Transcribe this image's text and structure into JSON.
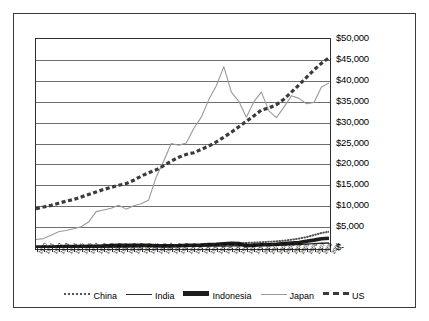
{
  "chart_data": {
    "type": "line",
    "title": "",
    "xlabel": "",
    "ylabel": "",
    "ylim": [
      0,
      50000
    ],
    "ytick_values": [
      0,
      5000,
      10000,
      15000,
      20000,
      25000,
      30000,
      35000,
      40000,
      45000,
      50000
    ],
    "ytick_labels": [
      "$-",
      "$5,000",
      "$10,000",
      "$15,000",
      "$20,000",
      "$25,000",
      "$30,000",
      "$35,000",
      "$40,000",
      "$45,000",
      "$50,000"
    ],
    "grid": true,
    "legend_position": "bottom",
    "x": [
      1970,
      1971,
      1972,
      1973,
      1974,
      1975,
      1976,
      1977,
      1978,
      1979,
      1980,
      1981,
      1982,
      1983,
      1984,
      1985,
      1986,
      1987,
      1988,
      1989,
      1990,
      1991,
      1992,
      1993,
      1994,
      1995,
      1996,
      1997,
      1998,
      1999,
      2000,
      2001,
      2002,
      2003,
      2004,
      2005,
      2006,
      2007,
      2008,
      2009
    ],
    "xtick_labels": [
      "1970",
      "1971",
      "1972",
      "1973",
      "1974",
      "1975",
      "1976",
      "1977",
      "1978",
      "1979",
      "1980",
      "1981",
      "1982",
      "1983",
      "1984",
      "1985",
      "1986",
      "1987",
      "1988",
      "1989",
      "1990",
      "1991",
      "1992",
      "1993",
      "1994",
      "1995",
      "1996",
      "1997",
      "1998",
      "1999",
      "2000",
      "2001",
      "2002",
      "2003",
      "2004",
      "2005",
      "2006",
      "2007",
      "2008",
      "2009"
    ],
    "series": [
      {
        "name": "China",
        "style": "dotted",
        "color": "#555555",
        "values": [
          120,
          125,
          130,
          140,
          145,
          150,
          150,
          160,
          175,
          195,
          215,
          230,
          255,
          285,
          325,
          365,
          395,
          430,
          480,
          510,
          530,
          570,
          640,
          730,
          830,
          930,
          1030,
          1130,
          1210,
          1290,
          1380,
          1480,
          1600,
          1760,
          1990,
          2250,
          2600,
          3100,
          3600,
          3900
        ]
      },
      {
        "name": "India",
        "style": "thin-solid",
        "color": "#2b2b2b",
        "values": [
          180,
          185,
          180,
          195,
          215,
          225,
          220,
          240,
          255,
          260,
          270,
          290,
          300,
          320,
          330,
          340,
          350,
          370,
          400,
          410,
          420,
          420,
          430,
          440,
          460,
          490,
          520,
          540,
          560,
          600,
          620,
          630,
          660,
          700,
          760,
          830,
          920,
          1050,
          1150,
          1200
        ]
      },
      {
        "name": "Indonesia",
        "style": "thick-solid",
        "color": "#1d1d1d",
        "values": [
          200,
          215,
          235,
          280,
          330,
          350,
          370,
          400,
          430,
          480,
          560,
          620,
          640,
          630,
          640,
          660,
          550,
          500,
          510,
          550,
          620,
          660,
          720,
          830,
          900,
          1020,
          1130,
          1080,
          560,
          660,
          790,
          790,
          900,
          1070,
          1160,
          1290,
          1620,
          1880,
          2220,
          2350
        ]
      },
      {
        "name": "Japan",
        "style": "light-solid",
        "color": "#9a9a9a",
        "values": [
          2050,
          2250,
          3050,
          3900,
          4200,
          4600,
          5100,
          6200,
          8700,
          9100,
          9500,
          10200,
          9300,
          10100,
          10600,
          11500,
          17000,
          20800,
          25000,
          24600,
          25100,
          28600,
          31300,
          35500,
          38800,
          43400,
          37300,
          35100,
          31300,
          35000,
          37300,
          32800,
          31200,
          33700,
          36400,
          35800,
          34500,
          34800,
          38500,
          39500
        ]
      },
      {
        "name": "US",
        "style": "thick-dashed",
        "color": "#3b3b3b",
        "values": [
          9400,
          9900,
          10700,
          11800,
          12500,
          13500,
          14800,
          16200,
          18000,
          19800,
          21400,
          23600,
          24300,
          26200,
          28700,
          30400,
          31800,
          33300,
          35400,
          37400,
          38900,
          39600,
          41400,
          42900,
          44800,
          46400,
          48400,
          50900,
          53200,
          55900,
          58600,
          59400,
          60600,
          62800,
          66000,
          69100,
          72000,
          74500,
          75800,
          76500
        ]
      }
    ],
    "us_values_plot": [
      9400,
      9800,
      10200,
      10700,
      11200,
      11600,
      12200,
      12800,
      13400,
      14000,
      14500,
      15000,
      15400,
      16200,
      17200,
      18000,
      18700,
      19700,
      20800,
      21700,
      22400,
      22800,
      23600,
      24400,
      25400,
      26500,
      27700,
      29000,
      30300,
      31600,
      33000,
      33500,
      34300,
      35600,
      37300,
      39000,
      40800,
      42600,
      44200,
      45500
    ],
    "legend": [
      {
        "name": "China",
        "style": "dotted"
      },
      {
        "name": "India",
        "style": "thin-solid"
      },
      {
        "name": "Indonesia",
        "style": "thick-solid"
      },
      {
        "name": "Japan",
        "style": "light-solid"
      },
      {
        "name": "US",
        "style": "thick-dashed"
      }
    ]
  }
}
